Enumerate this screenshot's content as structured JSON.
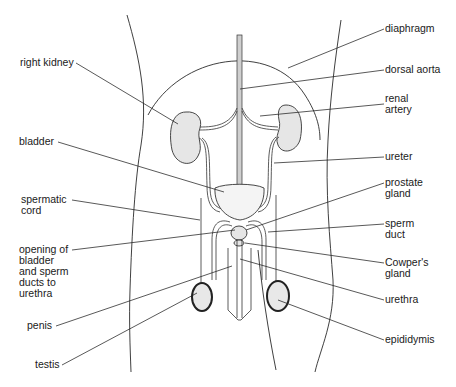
{
  "diagram": {
    "labels": {
      "diaphragm": "diaphragm",
      "dorsal_aorta": "dorsal aorta",
      "renal_artery": "renal\nartery",
      "right_kidney": "right kidney",
      "ureter": "ureter",
      "bladder": "bladder",
      "prostate_gland": "prostate\ngland",
      "spermatic_cord": "spermatic\ncord",
      "sperm_duct": "sperm\nduct",
      "opening": "opening of\nbladder\nand sperm\nducts to\nurethra",
      "cowpers_gland": "Cowper's\ngland",
      "penis": "penis",
      "urethra": "urethra",
      "testis": "testis",
      "epididymis": "epididymis"
    },
    "colors": {
      "line": "#222222",
      "organ_fill": "#e6e6e6",
      "background": "#ffffff"
    }
  }
}
